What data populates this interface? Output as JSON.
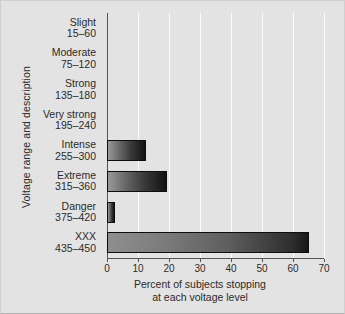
{
  "chart_data": {
    "type": "bar",
    "orientation": "horizontal",
    "title": "",
    "xlabel_line1": "Percent of subjects stopping",
    "xlabel_line2": "at each voltage level",
    "ylabel": "Voltage range and description",
    "xlim": [
      0,
      70
    ],
    "xticks": [
      0,
      10,
      20,
      30,
      40,
      50,
      60,
      70
    ],
    "xtick_labels": [
      "0",
      "10",
      "20",
      "30",
      "40",
      "50",
      "60",
      "70"
    ],
    "grid": "vertical",
    "legend": "none",
    "categories": [
      "Slight 15–60",
      "Moderate 75–120",
      "Strong 135–180",
      "Very strong 195–240",
      "Intense 255–300",
      "Extreme 315–360",
      "Danger 375–420",
      "XXX 435–450"
    ],
    "category_parts": [
      {
        "name": "Slight",
        "range": "15–60"
      },
      {
        "name": "Moderate",
        "range": "75–120"
      },
      {
        "name": "Strong",
        "range": "135–180"
      },
      {
        "name": "Very strong",
        "range": "195–240"
      },
      {
        "name": "Intense",
        "range": "255–300"
      },
      {
        "name": "Extreme",
        "range": "315–360"
      },
      {
        "name": "Danger",
        "range": "375–420"
      },
      {
        "name": "XXX",
        "range": "435–450"
      }
    ],
    "values": [
      0,
      0,
      0,
      0,
      12.5,
      19.5,
      2.5,
      65
    ],
    "colors": {
      "background": "#e3e3e3",
      "gridline": "#fbfbfb",
      "axis": "#555555",
      "bar_light": "#9a9a9a",
      "bar_dark": "#121212",
      "text": "#2b2b2b"
    }
  }
}
